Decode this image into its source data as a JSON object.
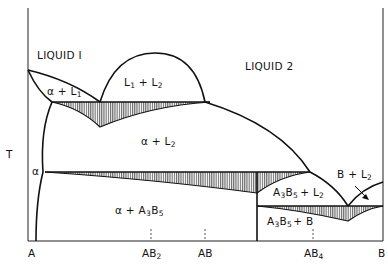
{
  "diagram": {
    "type": "binary phase diagram",
    "y_axis_label": "T",
    "x_axis": {
      "ticks": [
        {
          "label": "A",
          "sub": ""
        },
        {
          "label": "AB",
          "sub": "2"
        },
        {
          "label": "AB",
          "sub": ""
        },
        {
          "label": "AB",
          "sub": "4"
        },
        {
          "label": "B",
          "sub": ""
        }
      ]
    },
    "phase_labels": {
      "liquid1": "LIQUID I",
      "liquid2": "LIQUID 2",
      "alpha_l1": {
        "a": "α + L",
        "sub": "1"
      },
      "l1_l2": {
        "a": "L",
        "s1": "1",
        "b": " + L",
        "s2": "2"
      },
      "alpha_l2": {
        "a": "α  +  L",
        "sub": "2"
      },
      "alpha": "α",
      "alpha_a3b5": {
        "a": "α  +  A",
        "s1": "3",
        "b": "B",
        "s2": "5"
      },
      "a3b5_l2": {
        "a": "A",
        "s1": "3",
        "b": "B",
        "s2": "5",
        "c": "+ L",
        "s3": "2"
      },
      "a3b5_b": {
        "a": "A",
        "s1": "3",
        "b": "B",
        "s2": "5",
        "c": "+ B"
      },
      "b_l2": {
        "a": "B + L",
        "sub": "2"
      }
    },
    "colors": {
      "line": "#111111",
      "hatch": "#555555",
      "background": "#ffffff"
    }
  }
}
